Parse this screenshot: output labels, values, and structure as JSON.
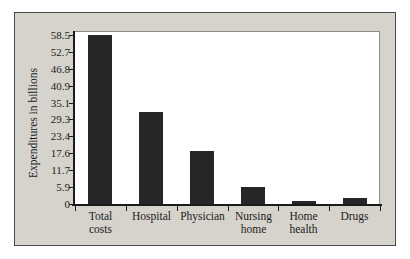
{
  "chart_data": {
    "type": "bar",
    "title": "",
    "xlabel": "",
    "ylabel": "Expenditures in billions",
    "categories": [
      "Total costs",
      "Hospital",
      "Physician",
      "Nursing home",
      "Home health",
      "Drugs"
    ],
    "category_lines": [
      [
        "Total",
        "costs"
      ],
      [
        "Hospital"
      ],
      [
        "Physician"
      ],
      [
        "Nursing",
        "home"
      ],
      [
        "Home",
        "health"
      ],
      [
        "Drugs"
      ]
    ],
    "values": [
      58.5,
      32.0,
      18.2,
      5.9,
      1.0,
      2.1
    ],
    "ylim": [
      0,
      58.5
    ],
    "ytick_labels": [
      "58.5",
      "52.7",
      "46.8",
      "40.9",
      "35.1",
      "29.3",
      "23.4",
      "17.6",
      "11.7",
      "5.9",
      "0"
    ],
    "ytick_values": [
      58.5,
      52.7,
      46.8,
      40.9,
      35.1,
      29.3,
      23.4,
      17.6,
      11.7,
      5.9,
      0
    ],
    "grid": false,
    "legend": null,
    "bar_color": "#262626",
    "plot_background": "#ffffff",
    "panel_background": "#d6d3cd",
    "axis_color": "#1a1a1a"
  }
}
